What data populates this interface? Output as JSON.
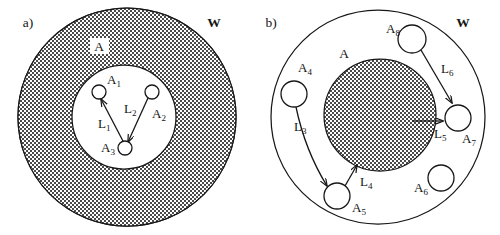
{
  "figure": {
    "background_color": "#ffffff",
    "ink_color": "#171717",
    "panels": [
      {
        "id": "a",
        "tag": "a)",
        "tag_pos": [
          28,
          27
        ],
        "universe_label": "W",
        "universe_label_pos": [
          214,
          27
        ],
        "region_label": "A",
        "region_label_pos": [
          99,
          50
        ],
        "region_patch": [
          90,
          38,
          19,
          16
        ],
        "outer_circle": {
          "cx": 127,
          "cy": 117,
          "r": 109
        },
        "inner_circle": {
          "cx": 124,
          "cy": 117,
          "r": 52
        },
        "shaded_ring": true,
        "shaded_disk": false,
        "nodes": [
          {
            "id": "A1",
            "label": "A",
            "sub": "1",
            "cx": 99,
            "cy": 92,
            "r": 7,
            "label_pos": [
              107,
              84
            ]
          },
          {
            "id": "A2",
            "label": "A",
            "sub": "2",
            "cx": 152,
            "cy": 92,
            "r": 7,
            "label_pos": [
              152,
              118
            ]
          },
          {
            "id": "A3",
            "label": "A",
            "sub": "3",
            "cx": 125,
            "cy": 148,
            "r": 7,
            "label_pos": [
              101,
              152
            ]
          }
        ],
        "edges": [
          {
            "id": "L1",
            "label": "L",
            "sub": "1",
            "from": "A3",
            "to": "A1",
            "label_pos": [
              98,
              128
            ]
          },
          {
            "id": "L2",
            "label": "L",
            "sub": "2",
            "from": "A2",
            "to": "A3",
            "label_pos": [
              124,
              113
            ]
          }
        ]
      },
      {
        "id": "b",
        "tag": "b)",
        "tag_pos": [
          271,
          27
        ],
        "universe_label": "W",
        "universe_label_pos": [
          463,
          27
        ],
        "region_label": "A",
        "region_label_pos": [
          344,
          57
        ],
        "region_patch": [
          337,
          45,
          17,
          15
        ],
        "outer_circle": {
          "cx": 378,
          "cy": 117,
          "r": 107
        },
        "inner_circle": {
          "cx": 380,
          "cy": 115,
          "r": 56
        },
        "shaded_ring": false,
        "shaded_disk": true,
        "nodes": [
          {
            "id": "A4",
            "label": "A",
            "sub": "4",
            "cx": 294,
            "cy": 94,
            "r": 13,
            "label_pos": [
              298,
              72
            ]
          },
          {
            "id": "A5",
            "label": "A",
            "sub": "5",
            "cx": 337,
            "cy": 196,
            "r": 13,
            "label_pos": [
              352,
              212
            ]
          },
          {
            "id": "A6",
            "label": "A",
            "sub": "6",
            "cx": 441,
            "cy": 178,
            "r": 13,
            "label_pos": [
              414,
              192
            ]
          },
          {
            "id": "A7",
            "label": "A",
            "sub": "7",
            "cx": 458,
            "cy": 118,
            "r": 13,
            "label_pos": [
              462,
              143
            ]
          },
          {
            "id": "A8",
            "label": "A",
            "sub": "8",
            "cx": 412,
            "cy": 39,
            "r": 14,
            "label_pos": [
              386,
              33
            ]
          }
        ],
        "edges": [
          {
            "id": "L3",
            "label": "L",
            "sub": "3",
            "from": "A4",
            "to": "A5",
            "label_pos": [
              294,
              131
            ]
          },
          {
            "id": "L4",
            "label": "L",
            "sub": "4",
            "from": "A5",
            "to": "A",
            "label_pos": [
              360,
              186
            ]
          },
          {
            "id": "L5",
            "label": "L",
            "sub": "5",
            "from": "A",
            "to": "A7",
            "label_pos": [
              434,
              138
            ]
          },
          {
            "id": "L6",
            "label": "L",
            "sub": "6",
            "from": "A8",
            "to": "A7",
            "label_pos": [
              441,
              73
            ]
          }
        ]
      }
    ]
  }
}
